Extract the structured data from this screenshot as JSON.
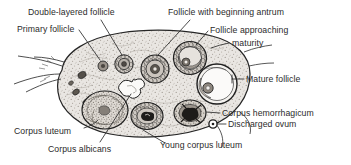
{
  "figure": {
    "type": "anatomical-histology-diagram",
    "ink_color": "#2b2b2b",
    "stroma_color": "#b9b4ae",
    "background_color": "#ffffff"
  },
  "labels": [
    {
      "id": "double-layered-follicle",
      "text": "Double-layered follicle",
      "x": 28,
      "y": 7
    },
    {
      "id": "follicle-beginning-antrum",
      "text": "Follicle with beginning antrum",
      "x": 168,
      "y": 7
    },
    {
      "id": "primary-follicle",
      "text": "Primary follicle",
      "x": 17,
      "y": 24
    },
    {
      "id": "follicle-approaching",
      "text": "Follicle approaching",
      "x": 210,
      "y": 25
    },
    {
      "id": "maturity",
      "text": "maturity",
      "x": 232,
      "y": 38
    },
    {
      "id": "mature-follicle",
      "text": "Mature follicle",
      "x": 246,
      "y": 74
    },
    {
      "id": "corpus-hemorrhagicum",
      "text": "Corpus hemorrhagicum",
      "x": 222,
      "y": 109
    },
    {
      "id": "discharged-ovum",
      "text": "Discharged ovum",
      "x": 228,
      "y": 121
    },
    {
      "id": "corpus-luteum",
      "text": "Corpus luteum",
      "x": 14,
      "y": 127
    },
    {
      "id": "young-corpus-luteum",
      "text": "Young corpus luteum",
      "x": 160,
      "y": 141
    },
    {
      "id": "corpus-albicans",
      "text": "Corpus albicans",
      "x": 48,
      "y": 145
    }
  ],
  "structures": [
    {
      "id": "primary-follicle-body",
      "name": "Primary follicle"
    },
    {
      "id": "double-layered-follicle-body",
      "name": "Double-layered follicle"
    },
    {
      "id": "antral-follicle-body",
      "name": "Follicle with beginning antrum"
    },
    {
      "id": "approaching-maturity-body",
      "name": "Follicle approaching maturity"
    },
    {
      "id": "mature-follicle-body",
      "name": "Mature follicle"
    },
    {
      "id": "corpus-hemorrhagicum-body",
      "name": "Corpus hemorrhagicum"
    },
    {
      "id": "discharged-ovum-body",
      "name": "Discharged ovum"
    },
    {
      "id": "young-corpus-luteum-body",
      "name": "Young corpus luteum"
    },
    {
      "id": "corpus-luteum-body",
      "name": "Corpus luteum"
    },
    {
      "id": "corpus-albicans-body",
      "name": "Corpus albicans"
    },
    {
      "id": "ovarian-stroma",
      "name": "Ovarian stroma"
    },
    {
      "id": "ovary-outline",
      "name": "Ovary outline"
    },
    {
      "id": "hilum-attachment",
      "name": "Hilum / mesovarium attachment"
    }
  ]
}
